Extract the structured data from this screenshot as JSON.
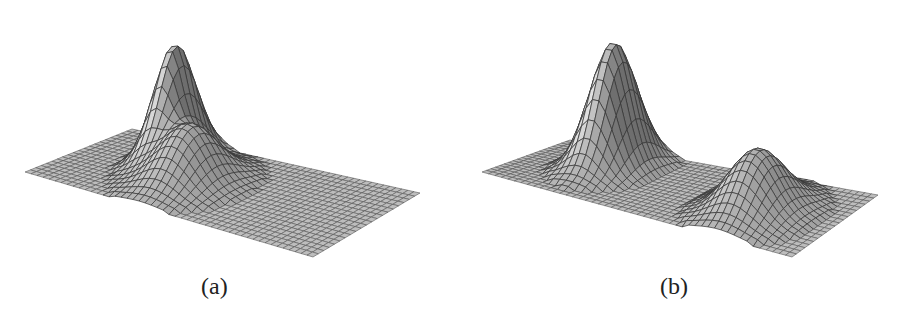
{
  "figure": {
    "panels": [
      {
        "id": "a",
        "caption": "(a)",
        "description": "3D mesh surface on a flat gridded plane: tall narrow peak merging into a lower broad second hump (overlapping bumps)",
        "peaks": [
          {
            "u": 0.26,
            "v": 0.3,
            "height": 1.0,
            "sigma_u": 0.045,
            "sigma_v": 0.16
          },
          {
            "u": 0.4,
            "v": 0.55,
            "height": 0.52,
            "sigma_u": 0.075,
            "sigma_v": 0.2
          }
        ]
      },
      {
        "id": "b",
        "caption": "(b)",
        "description": "3D mesh surface on a flat gridded plane: two well-separated bumps, a tall narrow one at left and a lower broad one at right",
        "peaks": [
          {
            "u": 0.24,
            "v": 0.35,
            "height": 1.0,
            "sigma_u": 0.055,
            "sigma_v": 0.2
          },
          {
            "u": 0.76,
            "v": 0.55,
            "height": 0.5,
            "sigma_u": 0.075,
            "sigma_v": 0.22
          }
        ]
      }
    ],
    "colors": {
      "surface_light": "#c8c8c8",
      "surface_dark": "#8a8a8a",
      "grid_line": "#3a3a3a",
      "background": "#ffffff"
    }
  }
}
